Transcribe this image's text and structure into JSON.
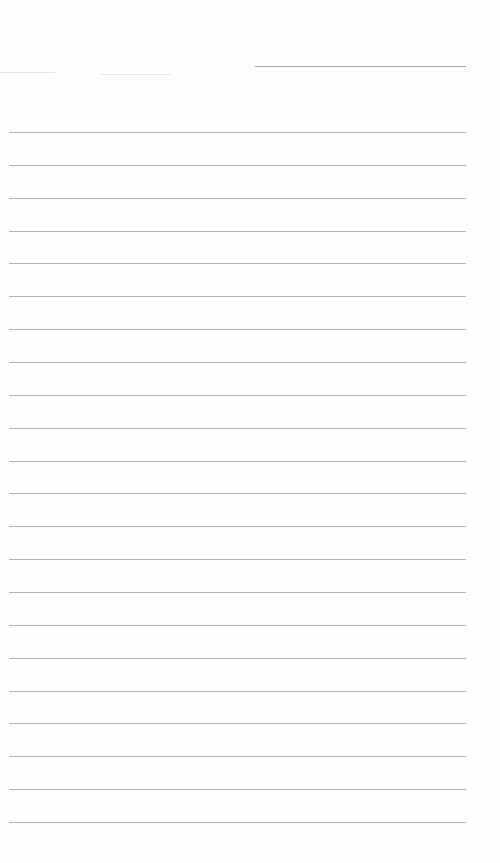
{
  "page": {
    "type": "lined-paper",
    "header_line": {
      "top": 66,
      "left": 255,
      "width": 211
    },
    "title_text": "",
    "rules": {
      "first_top": 132,
      "spacing": 32.86,
      "count": 22,
      "left": 9,
      "width": 457,
      "color": "#b4b4b4"
    },
    "background_color": "#fefefe"
  }
}
